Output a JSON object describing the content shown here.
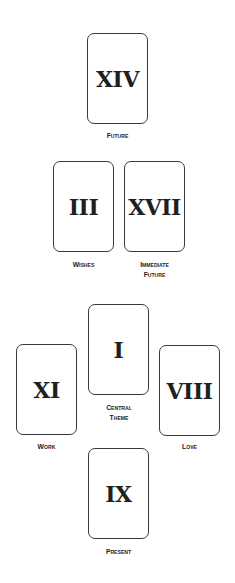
{
  "spread": {
    "cards": [
      {
        "id": "future",
        "numeral": "XIV",
        "label": "Future",
        "x": 87,
        "y": 33
      },
      {
        "id": "wishes",
        "numeral": "III",
        "label": "Wishes",
        "x": 53,
        "y": 161
      },
      {
        "id": "immediate-future",
        "numeral": "XVII",
        "label": "Immediate\nFuture",
        "x": 124,
        "y": 161
      },
      {
        "id": "work",
        "numeral": "XI",
        "label": "Work",
        "x": 16,
        "y": 344
      },
      {
        "id": "central-theme",
        "numeral": "I",
        "label": "Central\nTheme",
        "x": 88,
        "y": 304
      },
      {
        "id": "love",
        "numeral": "VIII",
        "label": "Love",
        "x": 159,
        "y": 345
      },
      {
        "id": "present",
        "numeral": "IX",
        "label": "Present",
        "x": 88,
        "y": 448
      }
    ]
  }
}
